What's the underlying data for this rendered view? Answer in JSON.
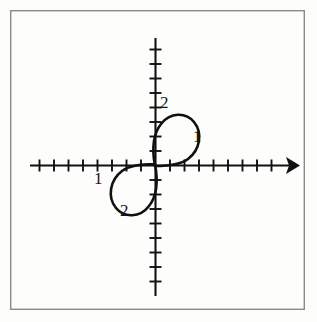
{
  "figure": {
    "kind": "cartesian-plot",
    "background_color": "#fdfdfc",
    "frame": {
      "name": "figure-border",
      "color": "#8a8a8a",
      "x": 10,
      "y": 10,
      "width": 295,
      "height": 300,
      "stroke_width": 1.4
    },
    "ink_color": "#111111"
  },
  "chart_data": {
    "type": "line",
    "title": "",
    "subtitle": "",
    "xlabel": "",
    "ylabel": "",
    "grid": false,
    "legend": null,
    "axes": {
      "origin_px": {
        "x": 155,
        "y": 165
      },
      "unit_px": 14.5,
      "xaxis": {
        "name": "x-axis",
        "from_px": 30,
        "to_px": 296,
        "arrow_at": "right",
        "tick_count_left": 8,
        "tick_count_right": 9,
        "tick_half_length": 6,
        "xlim": [
          -8.5,
          9.5
        ]
      },
      "yaxis": {
        "name": "y-axis",
        "from_px": 38,
        "to_px": 296,
        "arrow_at": "none",
        "tick_count_up": 8,
        "tick_count_down": 8,
        "tick_half_length": 6,
        "ylim": [
          -9,
          8.5
        ]
      }
    },
    "annotations": [
      {
        "name": "label-top",
        "text": "2",
        "value": 2,
        "near": "upper-loop-apex",
        "x_px": 160,
        "y_px": 94
      },
      {
        "name": "label-right",
        "text": "1",
        "value": 1,
        "near": "upper-loop-right-edge",
        "x_px": 193,
        "y_px": 128
      },
      {
        "name": "label-left",
        "text": "1",
        "value": 1,
        "near": "lower-loop-left-edge",
        "x_px": 94,
        "y_px": 170
      },
      {
        "name": "label-bottom",
        "text": "2",
        "value": 2,
        "near": "lower-loop-nadir",
        "x_px": 120,
        "y_px": 202
      }
    ],
    "curve": {
      "name": "figure-eight-curve",
      "stroke_width": 2.6,
      "color": "#111111",
      "upper_loop_path": "M 155 166 C 152 150 153 134 161 124 C 170 112 186 112 194 122 C 203 133 200 150 188 159 C 180 165 167 166 155 166",
      "lower_loop_path": "M 155 164 C 158 180 157 196 149 206 C 140 218 124 218 116 208 C 107 197 110 180 122 171 C 130 165 143 164 155 164",
      "upper_loop_extent_px": {
        "left": 150,
        "right": 201,
        "top": 112,
        "bottom": 166
      },
      "lower_loop_extent_px": {
        "left": 109,
        "right": 160,
        "top": 164,
        "bottom": 218
      }
    }
  }
}
